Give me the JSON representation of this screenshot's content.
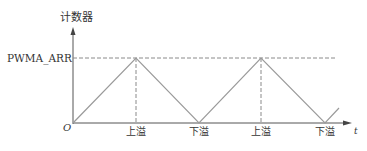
{
  "diagram": {
    "y_axis_label": "计数器",
    "x_axis_label": "t",
    "origin_label": "O",
    "level_label": "PWMA_ARR",
    "events": [
      {
        "label": "上溢",
        "x": 136
      },
      {
        "label": "下溢",
        "x": 199
      },
      {
        "label": "上溢",
        "x": 261
      },
      {
        "label": "下溢",
        "x": 325
      }
    ],
    "colors": {
      "axis": "#555555",
      "wave": "#9a9a9a",
      "dash": "#8a8a8a",
      "text": "#333333"
    }
  },
  "chart_data": {
    "type": "line",
    "xlabel": "t",
    "ylabel": "计数器",
    "series": [
      {
        "name": "counter",
        "x": [
          0,
          1,
          2,
          3,
          4,
          4.22
        ],
        "y": [
          0,
          1,
          0,
          1,
          0,
          0.22
        ]
      }
    ],
    "annotations": [
      "PWMA_ARR",
      "上溢",
      "下溢",
      "上溢",
      "下溢"
    ],
    "grid": false
  }
}
